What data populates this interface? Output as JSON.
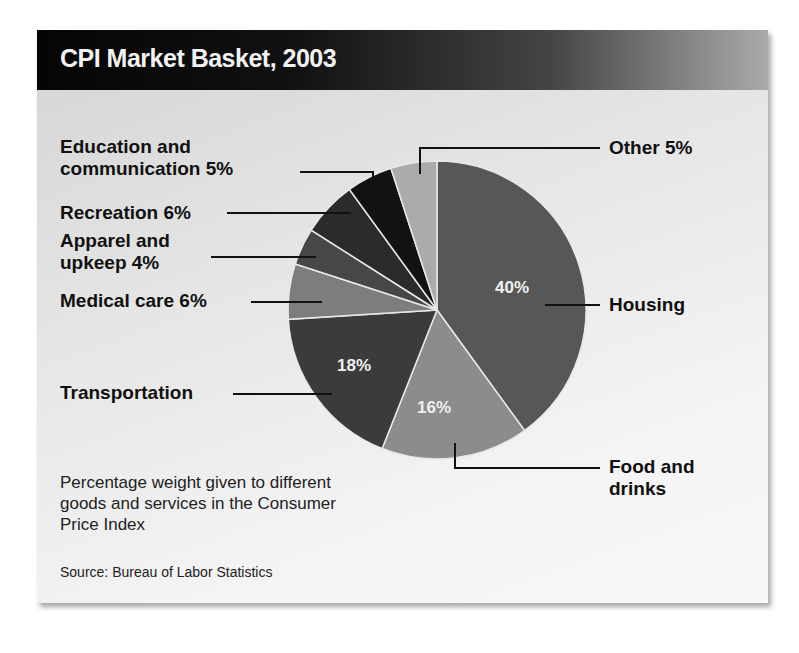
{
  "header": {
    "title": "CPI Market Basket, 2003"
  },
  "caption": "Percentage weight given to different goods and services in the Consumer Price Index",
  "source": "Source: Bureau of Labor Statistics",
  "labels": {
    "education_line1": "Education and",
    "education_line2": "communication 5%",
    "recreation": "Recreation 6%",
    "apparel_line1": "Apparel and",
    "apparel_line2": "upkeep 4%",
    "medical": "Medical care 6%",
    "transportation": "Transportation",
    "other": "Other 5%",
    "housing": "Housing",
    "food_line1": "Food and",
    "food_line2": "drinks",
    "housing_pct": "40%",
    "food_pct": "16%",
    "transport_pct": "18%"
  },
  "chart_data": {
    "type": "pie",
    "title": "CPI Market Basket, 2003",
    "subtitle": "Percentage weight given to different goods and services in the Consumer Price Index",
    "categories": [
      "Housing",
      "Food and drinks",
      "Transportation",
      "Medical care",
      "Apparel and upkeep",
      "Recreation",
      "Education and communication",
      "Other"
    ],
    "values": [
      40,
      16,
      18,
      6,
      4,
      6,
      5,
      5
    ],
    "colors": [
      "#575757",
      "#8c8c8c",
      "#3b3b3b",
      "#7d7d7d",
      "#474747",
      "#2b2b2b",
      "#121212",
      "#ababab"
    ],
    "unit": "%",
    "start_angle": "12 o'clock, clockwise",
    "source": "Bureau of Labor Statistics"
  }
}
